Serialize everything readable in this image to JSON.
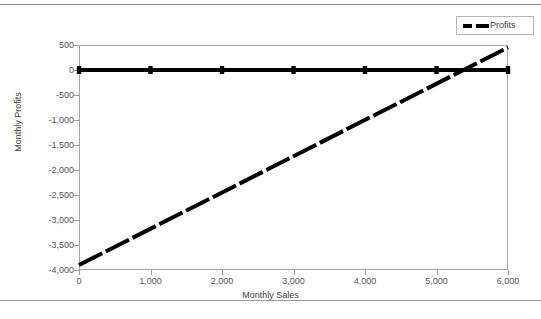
{
  "page": {
    "cropped_header_text": "",
    "background_color": "#ffffff",
    "rule_color": "#8e8e8e"
  },
  "legend": {
    "position": "top-right",
    "entries": [
      {
        "label": "Profits",
        "color": "#000000",
        "style": "dashed"
      }
    ]
  },
  "chart_data": {
    "type": "line",
    "title": "",
    "xlabel": "Monthly Sales",
    "ylabel": "Monthly Profits",
    "xlim": [
      0,
      6000
    ],
    "ylim": [
      -4000,
      500
    ],
    "xticks": [
      0,
      1000,
      2000,
      3000,
      4000,
      5000,
      6000
    ],
    "xtick_labels": [
      "0",
      "1,000",
      "2,000",
      "3,000",
      "4,000",
      "5,000",
      "6,000"
    ],
    "yticks": [
      500,
      0,
      -500,
      -1000,
      -1500,
      -2000,
      -2500,
      -3000,
      -3500,
      -4000
    ],
    "ytick_labels": [
      "500",
      "0",
      "-500",
      "-1,000",
      "-1,500",
      "-2,000",
      "-2,500",
      "-3,000",
      "-3,500",
      "-4,000"
    ],
    "grid": false,
    "legend_position": "top-right",
    "series": [
      {
        "name": "Zero Baseline",
        "color": "#000000",
        "style": "solid",
        "width": 4,
        "marker": "square",
        "x": [
          0,
          1000,
          2000,
          3000,
          4000,
          5000,
          6000
        ],
        "values": [
          0,
          0,
          0,
          0,
          0,
          0,
          0
        ]
      },
      {
        "name": "Profits",
        "color": "#000000",
        "style": "dashed",
        "width": 4,
        "marker": "none",
        "x": [
          0,
          6000
        ],
        "values": [
          -3900,
          450
        ]
      }
    ],
    "annotations": {
      "breakeven_x": 5400,
      "breakeven_y": 0
    }
  }
}
